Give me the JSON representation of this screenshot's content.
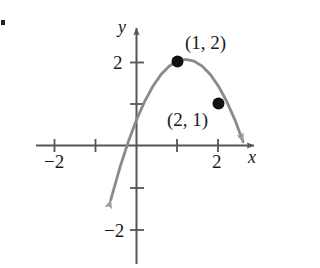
{
  "figure": {
    "kind": "coordinate-plane-parabola",
    "axis_labels": {
      "x": "x",
      "y": "y"
    },
    "x_tick_labels": {
      "neg2": "−2",
      "pos2": "2"
    },
    "y_tick_labels": {
      "pos2": "2",
      "neg2": "−2"
    },
    "point_labels": {
      "p1": "(1, 2)",
      "p2": "(2, 1)"
    },
    "colors": {
      "curve": "#8a8a8a",
      "axis": "#555555",
      "point": "#111111",
      "text": "#1a1a1a",
      "background": "#ffffff"
    }
  },
  "chart_data": {
    "type": "line",
    "title": "",
    "xlabel": "x",
    "ylabel": "y",
    "xlim": [
      -2.9,
      2.95
    ],
    "ylim": [
      -2.9,
      2.45
    ],
    "grid": false,
    "legend": null,
    "xticks": [
      -2,
      -1,
      1,
      2
    ],
    "xticklabels": [
      "−2",
      "",
      "",
      "2"
    ],
    "yticks": [
      2,
      1,
      -1,
      -2
    ],
    "yticklabels": [
      "2",
      "",
      "",
      "−2"
    ],
    "series": [
      {
        "name": "parabola",
        "kind": "curve",
        "equation": "y = -(x - 1.2)^2 + 2.05",
        "arrow_start": true,
        "arrow_end": true,
        "x": [
          -0.63,
          -0.4,
          -0.2,
          0,
          0.2,
          0.4,
          0.6,
          0.8,
          1.0,
          1.2,
          1.4,
          1.6,
          1.8,
          2.0,
          2.2,
          2.4,
          2.6
        ],
        "y": [
          -1.3,
          -0.51,
          0.09,
          0.61,
          1.05,
          1.41,
          1.69,
          1.89,
          2.01,
          2.05,
          2.01,
          1.89,
          1.69,
          1.41,
          1.05,
          0.61,
          0.09
        ]
      }
    ],
    "points": [
      {
        "label": "(1, 2)",
        "x": 1,
        "y": 2
      },
      {
        "label": "(2, 1)",
        "x": 2,
        "y": 1
      }
    ],
    "annotations": [
      {
        "text": "(1, 2)",
        "x": 1.25,
        "y": 2.45
      },
      {
        "text": "(2, 1)",
        "x": 0.85,
        "y": 0.65
      }
    ]
  }
}
